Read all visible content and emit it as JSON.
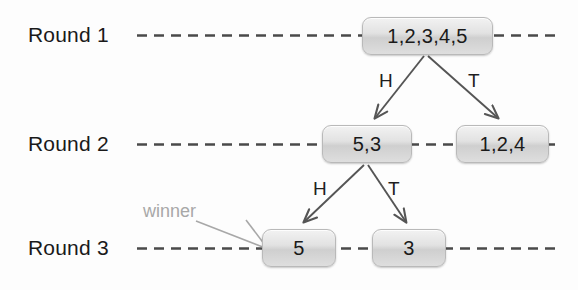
{
  "diagram": {
    "background_color": "#fdfdfd",
    "rounds": [
      {
        "label": "Round 1",
        "y": 35
      },
      {
        "label": "Round 2",
        "y": 144
      },
      {
        "label": "Round 3",
        "y": 248
      }
    ],
    "nodes": [
      {
        "id": "n1",
        "label": "1,2,3,4,5",
        "round": 1
      },
      {
        "id": "n2",
        "label": "5,3",
        "round": 2
      },
      {
        "id": "n3",
        "label": "1,2,4",
        "round": 2
      },
      {
        "id": "n4",
        "label": "5",
        "round": 3
      },
      {
        "id": "n5",
        "label": "3",
        "round": 3
      }
    ],
    "edges": [
      {
        "from": "n1",
        "to": "n2",
        "label": "H"
      },
      {
        "from": "n1",
        "to": "n3",
        "label": "T"
      },
      {
        "from": "n2",
        "to": "n4",
        "label": "H"
      },
      {
        "from": "n2",
        "to": "n5",
        "label": "T"
      }
    ],
    "annotation": {
      "label": "winner",
      "points_to": "n4",
      "color": "#a8a8a8"
    },
    "colors": {
      "text": "#1a1a1a",
      "dashed_line": "#4a4a4a",
      "arrow": "#555555",
      "node_border": "#b9b9b9",
      "annotation": "#a8a8a8"
    }
  }
}
